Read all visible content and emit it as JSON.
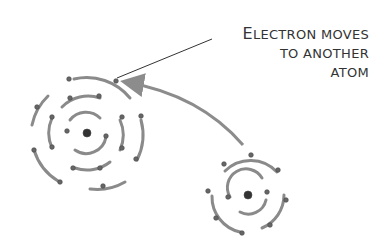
{
  "label": {
    "line1_first": "E",
    "line1_rest": "LECTRON MOVES",
    "line2": "TO ANOTHER",
    "line3": "ATOM"
  },
  "colors": {
    "orbit": "#8a8a8a",
    "electron": "#555555",
    "text": "#333333",
    "arrow": "#8c8c8c"
  },
  "atoms": [
    {
      "name": "large-atom",
      "center": [
        87,
        133
      ],
      "shells": [
        2,
        8,
        8
      ]
    },
    {
      "name": "small-atom",
      "center": [
        248,
        195
      ],
      "shells": [
        2,
        8
      ]
    }
  ]
}
